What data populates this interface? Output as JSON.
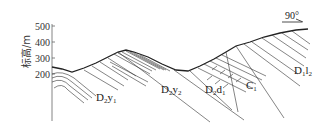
{
  "axis": {
    "ylabel": "标高/m",
    "ticks": [
      {
        "label": "500",
        "value": 500
      },
      {
        "label": "400",
        "value": 400
      },
      {
        "label": "300",
        "value": 300
      },
      {
        "label": "200",
        "value": 200
      }
    ]
  },
  "orientation": {
    "label": "90°"
  },
  "units": [
    {
      "main": "D",
      "sub1": "2",
      "letters": "y",
      "sub2": "1"
    },
    {
      "main": "D",
      "sub1": "2",
      "letters": "y",
      "sub2": "2"
    },
    {
      "main": "D",
      "sub1": "2",
      "letters": "d",
      "sub2": "1"
    },
    {
      "main": "C",
      "sub1": "",
      "letters": "",
      "sub2": "1"
    },
    {
      "main": "D",
      "sub1": "1",
      "letters": "l",
      "sub2": "2"
    }
  ],
  "colors": {
    "line": "#222222",
    "axis": "#555555",
    "background": "#ffffff"
  }
}
